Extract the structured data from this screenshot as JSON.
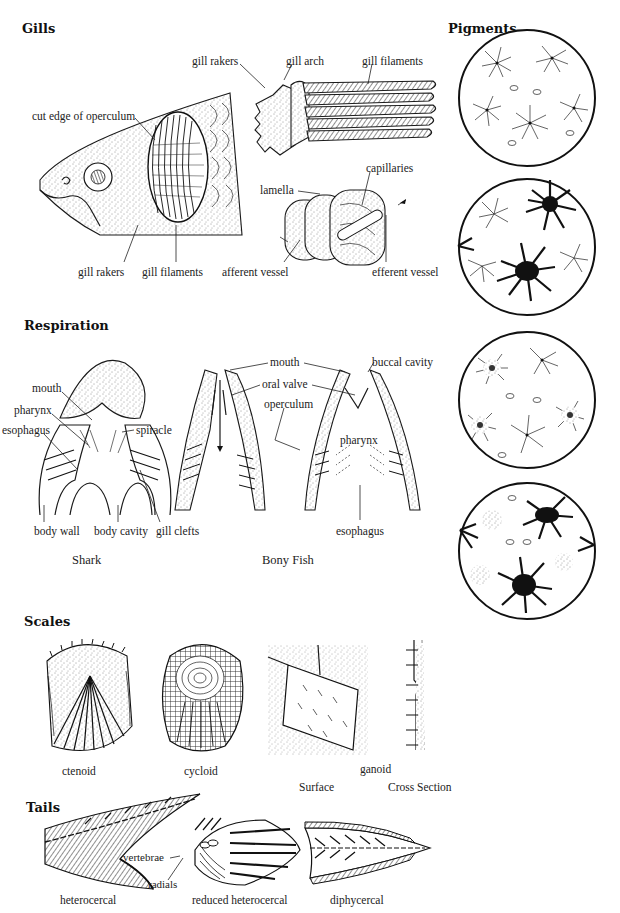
{
  "sections": {
    "gills": {
      "title": "Gills",
      "labels": {
        "cut_edge": "cut edge of operculum",
        "gill_rakers_top": "gill rakers",
        "gill_arch": "gill arch",
        "gill_filaments_top": "gill filaments",
        "lamella": "lamella",
        "capillaries": "capillaries",
        "gill_rakers_bottom": "gill rakers",
        "gill_filaments_bottom": "gill filaments",
        "afferent_vessel": "afferent vessel",
        "efferent_vessel": "efferent vessel"
      }
    },
    "pigments": {
      "title": "Pigments",
      "panels": [
        "expanded-light",
        "partially-dark",
        "stippled",
        "mixed-dark"
      ]
    },
    "respiration": {
      "title": "Respiration",
      "labels": {
        "mouth_shark": "mouth",
        "pharynx_shark": "pharynx",
        "esophagus_shark": "esophagus",
        "spiracle": "spiracle",
        "body_wall": "body wall",
        "body_cavity": "body cavity",
        "gill_clefts": "gill clefts",
        "mouth_bony": "mouth",
        "oral_valve": "oral valve",
        "operculum": "operculum",
        "buccal_cavity": "buccal cavity",
        "pharynx_bony": "pharynx",
        "esophagus_bony": "esophagus"
      },
      "captions": {
        "shark": "Shark",
        "bony_fish": "Bony Fish"
      }
    },
    "scales": {
      "title": "Scales",
      "captions": {
        "ctenoid": "ctenoid",
        "cycloid": "cycloid",
        "ganoid": "ganoid",
        "surface": "Surface",
        "cross_section": "Cross Section"
      }
    },
    "tails": {
      "title": "Tails",
      "labels": {
        "vertebrae": "vertebrae",
        "radials": "radials"
      },
      "captions": {
        "heterocercal": "heterocercal",
        "reduced_heterocercal": "reduced heterocercal",
        "diphycercal": "diphycercal"
      }
    }
  }
}
